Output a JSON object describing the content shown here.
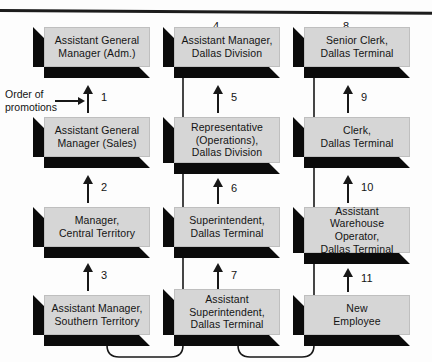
{
  "figure": {
    "caption_label": "Order of\npromotions",
    "box_fill_color": "#d6d6d6",
    "shadow_color": "#0b0b0b",
    "line_color": "#181818"
  },
  "columns": [
    {
      "name": "column-left",
      "boxes": [
        {
          "label": "Assistant General\nManager (Adm.)"
        },
        {
          "label": "Assistant General\nManager (Sales)"
        },
        {
          "label": "Manager,\nCentral Territory"
        },
        {
          "label": "Assistant Manager,\nSouthern Territory"
        }
      ],
      "steps": [
        "1",
        "2",
        "3"
      ]
    },
    {
      "name": "column-middle",
      "boxes": [
        {
          "label": "Assistant Manager,\nDallas Division"
        },
        {
          "label": "Representative\n(Operations),\nDallas Division"
        },
        {
          "label": "Superintendent,\nDallas Terminal"
        },
        {
          "label": "Assistant\nSuperintendent,\nDallas Terminal"
        }
      ],
      "steps": [
        "5",
        "6",
        "7"
      ],
      "wrap_step": "4"
    },
    {
      "name": "column-right",
      "boxes": [
        {
          "label": "Senior Clerk,\nDallas Terminal"
        },
        {
          "label": "Clerk,\nDallas Terminal"
        },
        {
          "label": "Assistant\nWarehouse Operator,\nDallas Terminal"
        },
        {
          "label": "New\nEmployee"
        }
      ],
      "steps": [
        "9",
        "10",
        "11"
      ],
      "wrap_step": "8"
    }
  ]
}
